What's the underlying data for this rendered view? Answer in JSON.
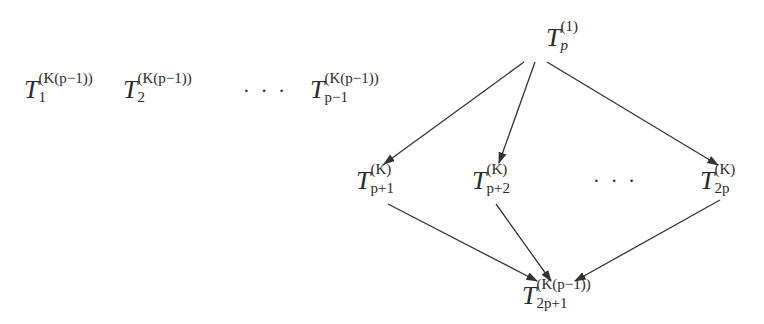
{
  "diagram": {
    "type": "task-dependency-graph",
    "independent_nodes": [
      {
        "id": "T1",
        "base": "T",
        "sub": "1",
        "sup": "(K(p−1))"
      },
      {
        "id": "T2",
        "base": "T",
        "sub": "2",
        "sup": "(K(p−1))"
      },
      {
        "id": "Tp-1",
        "base": "T",
        "sub": "p−1",
        "sup": "(K(p−1))"
      }
    ],
    "independent_ellipsis": "· · ·",
    "root": {
      "id": "Tp",
      "base": "T",
      "sub": "p",
      "sup": "(1)"
    },
    "middle_nodes": [
      {
        "id": "Tp+1",
        "base": "T",
        "sub": "p+1",
        "sup": "(K)"
      },
      {
        "id": "Tp+2",
        "base": "T",
        "sub": "p+2",
        "sup": "(K)"
      },
      {
        "id": "T2p",
        "base": "T",
        "sub": "2p",
        "sup": "(K)"
      }
    ],
    "middle_ellipsis": "· · ·",
    "sink": {
      "id": "T2p+1",
      "base": "T",
      "sub": "2p+1",
      "sup": "(K(p−1))"
    },
    "edges": [
      {
        "from": "Tp",
        "to": "Tp+1"
      },
      {
        "from": "Tp",
        "to": "Tp+2"
      },
      {
        "from": "Tp",
        "to": "T2p"
      },
      {
        "from": "Tp+1",
        "to": "T2p+1"
      },
      {
        "from": "Tp+2",
        "to": "T2p+1"
      },
      {
        "from": "T2p",
        "to": "T2p+1"
      }
    ],
    "colors": {
      "line": "#333333",
      "text": "#2a2a2a",
      "background": "#ffffff"
    }
  }
}
